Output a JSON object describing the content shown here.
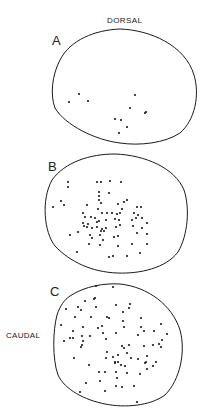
{
  "figure": {
    "labels": {
      "dorsal": "DORSAL",
      "caudal": "CAUDAL"
    },
    "ink_color": "#1a1a1a",
    "background": "#ffffff",
    "panels": [
      {
        "id": "A",
        "letter": "A",
        "outline": "M60,60 C70,40 95,30 120,29 C150,30 185,45 194,75 C200,95 195,120 180,133 C165,143 140,146 120,143 C95,140 65,125 55,108 C50,95 52,75 60,60 Z",
        "dots": [
          [
            69,
            102
          ],
          [
            79,
            94
          ],
          [
            88,
            101
          ],
          [
            135,
            95
          ],
          [
            130,
            108
          ],
          [
            146,
            112
          ],
          [
            145,
            113
          ],
          [
            115,
            119
          ],
          [
            121,
            120
          ],
          [
            127,
            127
          ],
          [
            119,
            133
          ]
        ]
      },
      {
        "id": "B",
        "letter": "B",
        "outline": "M52,180 C65,162 90,154 115,154 C145,155 175,168 184,190 C190,208 188,235 178,252 C166,268 140,274 117,273 C92,272 70,262 55,246 C44,232 41,200 52,180 Z",
        "dots": [
          [
            68,
            182
          ],
          [
            68,
            187
          ],
          [
            97,
            182
          ],
          [
            101,
            182
          ],
          [
            110,
            181
          ],
          [
            121,
            182
          ],
          [
            99,
            192
          ],
          [
            99,
            196
          ],
          [
            99,
            200
          ],
          [
            109,
            193
          ],
          [
            61,
            201
          ],
          [
            64,
            205
          ],
          [
            53,
            207
          ],
          [
            87,
            205
          ],
          [
            101,
            203
          ],
          [
            118,
            204
          ],
          [
            122,
            209
          ],
          [
            127,
            200
          ],
          [
            124,
            202
          ],
          [
            98,
            209
          ],
          [
            102,
            213
          ],
          [
            107,
            213
          ],
          [
            112,
            213
          ],
          [
            117,
            214
          ],
          [
            120,
            213
          ],
          [
            137,
            207
          ],
          [
            141,
            207
          ],
          [
            134,
            213
          ],
          [
            138,
            215
          ],
          [
            83,
            213
          ],
          [
            85,
            217
          ],
          [
            91,
            217
          ],
          [
            95,
            218
          ],
          [
            83,
            223
          ],
          [
            88,
            224
          ],
          [
            97,
            222
          ],
          [
            99,
            221
          ],
          [
            106,
            220
          ],
          [
            115,
            219
          ],
          [
            119,
            220
          ],
          [
            132,
            220
          ],
          [
            136,
            218
          ],
          [
            142,
            218
          ],
          [
            84,
            226
          ],
          [
            87,
            227
          ],
          [
            92,
            228
          ],
          [
            97,
            227
          ],
          [
            102,
            229
          ],
          [
            104,
            231
          ],
          [
            101,
            231
          ],
          [
            106,
            228
          ],
          [
            116,
            227
          ],
          [
            120,
            225
          ],
          [
            133,
            226
          ],
          [
            142,
            228
          ],
          [
            147,
            223
          ],
          [
            78,
            232
          ],
          [
            70,
            235
          ],
          [
            90,
            235
          ],
          [
            100,
            235
          ],
          [
            114,
            237
          ],
          [
            118,
            236
          ],
          [
            137,
            233
          ],
          [
            147,
            234
          ],
          [
            92,
            238
          ],
          [
            103,
            240
          ],
          [
            89,
            244
          ],
          [
            100,
            245
          ],
          [
            118,
            246
          ],
          [
            132,
            244
          ],
          [
            147,
            244
          ],
          [
            109,
            257
          ],
          [
            113,
            256
          ],
          [
            127,
            256
          ],
          [
            140,
            253
          ],
          [
            77,
            252
          ]
        ]
      },
      {
        "id": "C",
        "letter": "C",
        "outline": "M70,296 C85,286 105,283 120,284 C148,287 172,305 180,330 C186,352 180,380 165,395 C150,406 125,408 105,404 C85,400 65,390 58,375 C52,358 53,330 57,315 C60,306 64,300 70,296 Z",
        "dots": [
          [
            96,
            286
          ],
          [
            113,
            287
          ],
          [
            66,
            309
          ],
          [
            78,
            307
          ],
          [
            81,
            310
          ],
          [
            85,
            301
          ],
          [
            94,
            299
          ],
          [
            96,
            307
          ],
          [
            95,
            298
          ],
          [
            116,
            305
          ],
          [
            123,
            312
          ],
          [
            129,
            308
          ],
          [
            130,
            304
          ],
          [
            61,
            325
          ],
          [
            75,
            317
          ],
          [
            91,
            317
          ],
          [
            107,
            317
          ],
          [
            109,
            318
          ],
          [
            123,
            321
          ],
          [
            141,
            318
          ],
          [
            73,
            331
          ],
          [
            83,
            327
          ],
          [
            98,
            328
          ],
          [
            102,
            326
          ],
          [
            124,
            327
          ],
          [
            141,
            327
          ],
          [
            161,
            324
          ],
          [
            64,
            341
          ],
          [
            70,
            338
          ],
          [
            73,
            338
          ],
          [
            82,
            336
          ],
          [
            83,
            341
          ],
          [
            90,
            336
          ],
          [
            103,
            333
          ],
          [
            106,
            339
          ],
          [
            116,
            333
          ],
          [
            138,
            335
          ],
          [
            144,
            331
          ],
          [
            154,
            331
          ],
          [
            167,
            334
          ],
          [
            162,
            340
          ],
          [
            159,
            344
          ],
          [
            82,
            345
          ],
          [
            81,
            347
          ],
          [
            122,
            346
          ],
          [
            129,
            345
          ],
          [
            144,
            346
          ],
          [
            153,
            345
          ],
          [
            161,
            347
          ],
          [
            107,
            352
          ],
          [
            113,
            357
          ],
          [
            124,
            348
          ],
          [
            127,
            353
          ],
          [
            118,
            355
          ],
          [
            106,
            358
          ],
          [
            115,
            362
          ],
          [
            131,
            358
          ],
          [
            147,
            356
          ],
          [
            145,
            363
          ],
          [
            74,
            358
          ],
          [
            89,
            365
          ],
          [
            115,
            363
          ],
          [
            118,
            362
          ],
          [
            121,
            365
          ],
          [
            125,
            366
          ],
          [
            138,
            359
          ],
          [
            146,
            362
          ],
          [
            153,
            366
          ],
          [
            156,
            362
          ],
          [
            99,
            372
          ],
          [
            105,
            372
          ],
          [
            116,
            372
          ],
          [
            127,
            373
          ],
          [
            140,
            374
          ],
          [
            147,
            369
          ],
          [
            100,
            381
          ],
          [
            117,
            378
          ],
          [
            116,
            386
          ],
          [
            86,
            383
          ],
          [
            80,
            392
          ],
          [
            105,
            391
          ],
          [
            122,
            387
          ],
          [
            134,
            386
          ],
          [
            137,
            402
          ]
        ]
      }
    ]
  }
}
